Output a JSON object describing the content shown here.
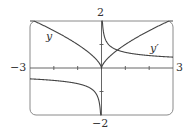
{
  "chart_data": {
    "type": "line",
    "title": "",
    "xlabel": "",
    "ylabel": "",
    "xlim": [
      -3,
      3
    ],
    "ylim": [
      -2,
      2
    ],
    "grid": false,
    "tick_labels": {
      "x_min": "−3",
      "x_max": "3",
      "y_max": "2",
      "y_min": "−2"
    },
    "x_ticks": [
      -2,
      -1,
      0,
      1,
      2
    ],
    "y_ticks": [
      -1,
      1
    ],
    "series": [
      {
        "name": "y",
        "label": "y",
        "expression": "x^(2/3)",
        "x": [
          -3,
          -2.5,
          -2,
          -1.5,
          -1,
          -0.5,
          -0.25,
          0,
          0.25,
          0.5,
          1,
          1.5,
          2,
          2.5,
          3
        ],
        "values": [
          2.08,
          1.84,
          1.59,
          1.31,
          1.0,
          0.63,
          0.4,
          0,
          0.4,
          0.63,
          1.0,
          1.31,
          1.59,
          1.84,
          2.08
        ]
      },
      {
        "name": "y'",
        "label": "y′",
        "expression": "(2/3) x^(-1/3)",
        "x": [
          -3,
          -2.5,
          -2,
          -1.5,
          -1,
          -0.5,
          -0.25,
          -0.1,
          -0.05,
          0.05,
          0.1,
          0.25,
          0.5,
          1,
          1.5,
          2,
          2.5,
          3
        ],
        "values": [
          -0.46,
          -0.49,
          -0.53,
          -0.58,
          -0.67,
          -0.84,
          -1.06,
          -1.44,
          -1.81,
          1.81,
          1.44,
          1.06,
          0.84,
          0.67,
          0.58,
          0.53,
          0.49,
          0.46
        ]
      }
    ],
    "legend": []
  },
  "labels": {
    "x_min": "−3",
    "x_max": "3",
    "y_max": "2",
    "y_min": "−2",
    "curve_y": "y",
    "curve_yprime": "y′"
  }
}
